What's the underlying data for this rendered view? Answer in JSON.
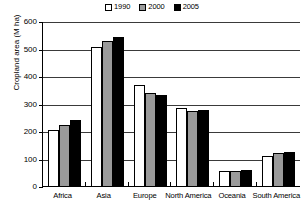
{
  "chart_data": {
    "type": "bar",
    "title": "",
    "xlabel": "",
    "ylabel": "Cropland area (M ha)",
    "ylim": [
      0,
      600
    ],
    "yticks": [
      0,
      100,
      200,
      300,
      400,
      500,
      600
    ],
    "grid": true,
    "legend_position": "top-center",
    "categories": [
      "Africa",
      "Asia",
      "Europe",
      "North America",
      "Oceania",
      "South America"
    ],
    "series": [
      {
        "name": "1990",
        "color": "#ffffff",
        "values": [
          203,
          506,
          367,
          282,
          55,
          110
        ]
      },
      {
        "name": "2000",
        "color": "#9a9a9a",
        "values": [
          221,
          528,
          340,
          274,
          54,
          121
        ]
      },
      {
        "name": "2005",
        "color": "#000000",
        "values": [
          239,
          542,
          332,
          275,
          58,
          124
        ]
      }
    ]
  },
  "legend": {
    "items": [
      {
        "label": "1990",
        "swatch": "legend-swatch-white"
      },
      {
        "label": "2000",
        "swatch": "legend-swatch-gray"
      },
      {
        "label": "2005",
        "swatch": "legend-swatch-black"
      }
    ]
  },
  "axes": {
    "y_title": "Cropland area (M ha)",
    "y_tick_labels": [
      "600",
      "500",
      "400",
      "300",
      "200",
      "100",
      "0"
    ],
    "x_tick_labels": [
      "Africa",
      "Asia",
      "Europe",
      "North America",
      "Oceania",
      "South America"
    ]
  }
}
